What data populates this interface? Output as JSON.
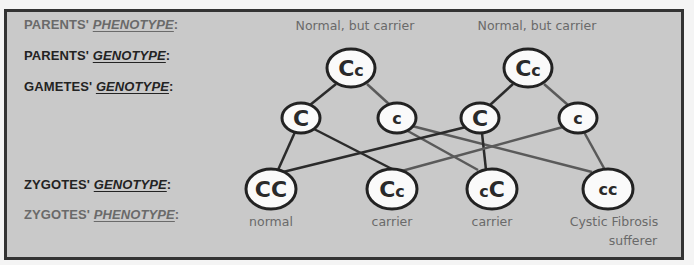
{
  "rows": {
    "parents_phenotype": {
      "prefix": "PARENTS' ",
      "emphasis": "PHENOTYPE",
      "suffix": ":"
    },
    "parents_genotype": {
      "prefix": "PARENTS' ",
      "emphasis": "GENOTYPE",
      "suffix": ":"
    },
    "gametes_genotype": {
      "prefix": "GAMETES' ",
      "emphasis": "GENOTYPE",
      "suffix": ":"
    },
    "zygotes_genotype": {
      "prefix": "ZYGOTES' ",
      "emphasis": "GENOTYPE",
      "suffix": ":"
    },
    "zygotes_phenotype": {
      "prefix": "ZYGOTES' ",
      "emphasis": "PHENOTYPE",
      "suffix": ":"
    }
  },
  "parents": [
    {
      "phenotype": "Normal, but carrier",
      "genotype": {
        "big": "C",
        "small": "c"
      }
    },
    {
      "phenotype": "Normal, but carrier",
      "genotype": {
        "big": "C",
        "small": "c"
      }
    }
  ],
  "gametes": [
    {
      "allele": "C",
      "dominant": true
    },
    {
      "allele": "c",
      "dominant": false
    },
    {
      "allele": "C",
      "dominant": true
    },
    {
      "allele": "c",
      "dominant": false
    }
  ],
  "zygotes": [
    {
      "genotype": "CC",
      "phenotype_line1": "normal",
      "phenotype_line2": ""
    },
    {
      "genotype": "Cc",
      "phenotype_line1": "carrier",
      "phenotype_line2": ""
    },
    {
      "genotype": "cC",
      "phenotype_line1": "carrier",
      "phenotype_line2": ""
    },
    {
      "genotype": "cc",
      "phenotype_line1": "Cystic Fibrosis",
      "phenotype_line2": "sufferer"
    }
  ],
  "colors": {
    "background": "#c9c9c9",
    "border": "#333333",
    "dominant_line": "#2b2b2b",
    "recessive_line": "#5a5a5a",
    "gray_text": "#6a6a6a",
    "dark_text": "#232323"
  }
}
